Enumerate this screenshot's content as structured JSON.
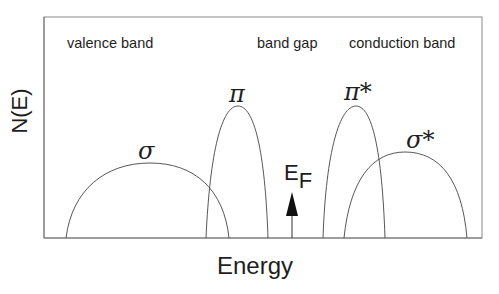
{
  "diagram": {
    "title": "",
    "y_axis_label": "N(E)",
    "x_axis_label": "Energy",
    "regions": [
      {
        "id": "valence",
        "label": "valence band"
      },
      {
        "id": "gap",
        "label": "band gap"
      },
      {
        "id": "conduction",
        "label": "conduction band"
      }
    ],
    "bands": [
      {
        "id": "sigma",
        "label": "σ",
        "start_x": 66,
        "end_x": 229,
        "peak_y": 163
      },
      {
        "id": "pi",
        "label": "π",
        "start_x": 206,
        "end_x": 268,
        "peak_y": 106
      },
      {
        "id": "pi-star",
        "label": "π*",
        "start_x": 323,
        "end_x": 385,
        "peak_y": 106
      },
      {
        "id": "sigma-star",
        "label": "σ*",
        "start_x": 344,
        "end_x": 467,
        "peak_y": 152
      }
    ],
    "fermi_level": {
      "label_main": "E",
      "label_sub": "F",
      "x": 292
    },
    "colors": {
      "line": "#444444",
      "text": "#1e1e1e",
      "arrow": "#111111"
    }
  }
}
